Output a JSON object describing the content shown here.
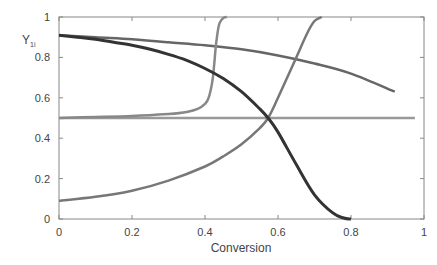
{
  "chart_data": {
    "type": "line",
    "title": "",
    "xlabel": "Conversion",
    "ylabel": "Y",
    "ylabel_subscript": "1i",
    "xlim": [
      0,
      1
    ],
    "ylim": [
      0,
      1
    ],
    "xticks": [
      0,
      0.2,
      0.4,
      0.6,
      0.8,
      1
    ],
    "xtick_labels": [
      "0",
      "0.2",
      "0.4",
      "0.6",
      "0.8",
      "1"
    ],
    "yticks": [
      0,
      0.2,
      0.4,
      0.6,
      0.8,
      1
    ],
    "ytick_labels": [
      "0",
      "0.2",
      "0.4",
      "0.6",
      "0.8",
      "1"
    ],
    "grid": false,
    "legend": null,
    "series": [
      {
        "name": "curve-dark-decreasing",
        "color": "#333333",
        "x": [
          0,
          0.05,
          0.1,
          0.15,
          0.2,
          0.25,
          0.3,
          0.35,
          0.4,
          0.45,
          0.5,
          0.55,
          0.573,
          0.6,
          0.65,
          0.7,
          0.75,
          0.78,
          0.8
        ],
        "y": [
          0.91,
          0.9,
          0.89,
          0.875,
          0.86,
          0.84,
          0.815,
          0.785,
          0.745,
          0.695,
          0.63,
          0.545,
          0.5,
          0.43,
          0.27,
          0.12,
          0.03,
          0.005,
          0
        ]
      },
      {
        "name": "curve-gray-slow-decrease",
        "color": "#666666",
        "x": [
          0,
          0.1,
          0.2,
          0.3,
          0.4,
          0.5,
          0.6,
          0.7,
          0.8,
          0.92
        ],
        "y": [
          0.91,
          0.9,
          0.89,
          0.875,
          0.86,
          0.84,
          0.81,
          0.77,
          0.72,
          0.63
        ]
      },
      {
        "name": "curve-steep-sigmoid",
        "color": "#888888",
        "x": [
          0,
          0.1,
          0.2,
          0.3,
          0.35,
          0.38,
          0.4,
          0.41,
          0.42,
          0.425,
          0.43,
          0.435,
          0.44,
          0.45,
          0.46
        ],
        "y": [
          0.5,
          0.505,
          0.51,
          0.52,
          0.53,
          0.545,
          0.57,
          0.6,
          0.68,
          0.76,
          0.86,
          0.93,
          0.97,
          0.995,
          1.0
        ]
      },
      {
        "name": "curve-rising",
        "color": "#777777",
        "x": [
          0,
          0.1,
          0.2,
          0.3,
          0.4,
          0.45,
          0.5,
          0.55,
          0.573,
          0.6,
          0.65,
          0.68,
          0.7,
          0.72
        ],
        "y": [
          0.09,
          0.11,
          0.14,
          0.19,
          0.26,
          0.31,
          0.37,
          0.45,
          0.5,
          0.6,
          0.8,
          0.92,
          0.98,
          1.0
        ]
      },
      {
        "name": "line-flat-0.5",
        "color": "#999999",
        "x": [
          0,
          0.975
        ],
        "y": [
          0.5,
          0.5
        ]
      }
    ]
  },
  "plot": {
    "left": 59,
    "top": 17,
    "right": 424,
    "bottom": 219
  }
}
